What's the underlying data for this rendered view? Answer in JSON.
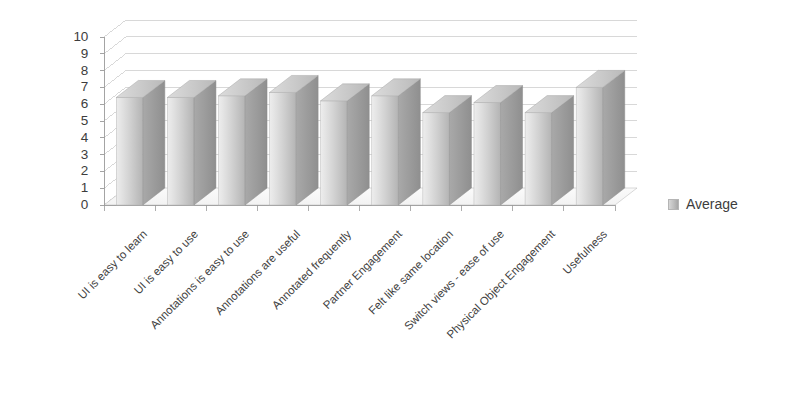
{
  "chart_data": {
    "type": "bar",
    "title": "",
    "subtitle": "",
    "xlabel": "",
    "ylabel": "",
    "ylim": [
      0,
      10
    ],
    "yticks": [
      0,
      1,
      2,
      3,
      4,
      5,
      6,
      7,
      8,
      9,
      10
    ],
    "grid": true,
    "legend_position": "right",
    "style": "3d-column",
    "categories": [
      "UI is easy to learn",
      "UI is easy to use",
      "Annotations is easy to use",
      "Annotations are useful",
      "Annotated frequently",
      "Partner Engagement",
      "Felt like same location",
      "Switch views - ease of use",
      "Physical Object Engagement",
      "Usefulness"
    ],
    "series": [
      {
        "name": "Average",
        "values": [
          6.4,
          6.4,
          6.5,
          6.7,
          6.2,
          6.5,
          5.5,
          6.1,
          5.5,
          7.0
        ]
      }
    ]
  },
  "legend": {
    "items": [
      {
        "label": "Average",
        "color": "#bdbdbd"
      }
    ]
  },
  "axis": {
    "y_tick_labels": [
      "10",
      "9",
      "8",
      "7",
      "6",
      "5",
      "4",
      "3",
      "2",
      "1",
      "0"
    ]
  },
  "colors": {
    "bar_front_light": "#e2e2e2",
    "bar_front_dark": "#b0b0b0",
    "bar_side": "#9d9d9d",
    "bar_top": "#cfcfcf",
    "gridline": "#c8c8c8",
    "axis": "#9a9a9a",
    "text": "#3d3d3d",
    "background": "#ffffff"
  }
}
